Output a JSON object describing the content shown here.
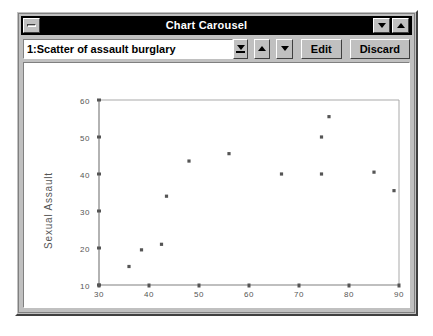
{
  "window": {
    "title": "Chart Carousel",
    "sysmenu_icon": "system-menu-icon",
    "minimize_icon": "minimize-icon",
    "maximize_icon": "maximize-icon"
  },
  "toolbar": {
    "combo_value": "1:Scatter of assault burglary",
    "combo_dropdown_icon": "chevron-down-icon",
    "prev_icon": "triangle-up-icon",
    "next_icon": "triangle-down-icon",
    "edit_label": "Edit",
    "discard_label": "Discard"
  },
  "chart_data": {
    "type": "scatter",
    "title": "",
    "xlabel": "Burglary",
    "ylabel": "Sexual Assault",
    "xlim": [
      30,
      90
    ],
    "ylim": [
      10,
      60
    ],
    "xticks": [
      30,
      40,
      50,
      60,
      70,
      80,
      90
    ],
    "yticks": [
      10,
      20,
      30,
      40,
      50,
      60
    ],
    "grid": false,
    "legend": "none",
    "marker": "square",
    "marker_color": "#555555",
    "points": [
      {
        "x": 36.0,
        "y": 15.0
      },
      {
        "x": 38.5,
        "y": 19.5
      },
      {
        "x": 42.5,
        "y": 21.0
      },
      {
        "x": 43.5,
        "y": 34.0
      },
      {
        "x": 48.0,
        "y": 43.5
      },
      {
        "x": 56.0,
        "y": 45.5
      },
      {
        "x": 66.5,
        "y": 40.0
      },
      {
        "x": 74.5,
        "y": 40.0
      },
      {
        "x": 74.5,
        "y": 50.0
      },
      {
        "x": 76.0,
        "y": 55.5
      },
      {
        "x": 85.0,
        "y": 40.5
      },
      {
        "x": 89.0,
        "y": 35.5
      }
    ]
  }
}
